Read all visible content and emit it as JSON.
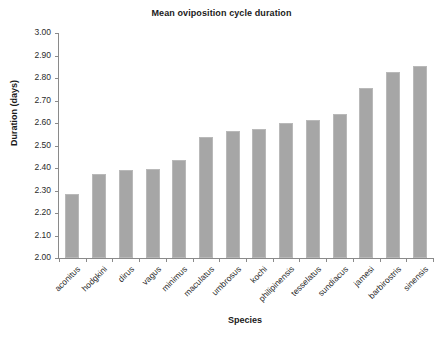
{
  "chart_data": {
    "type": "bar",
    "title": "Mean oviposition cycle duration",
    "xlabel": "Species",
    "ylabel": "Duration (days)",
    "categories": [
      "aconitus",
      "hodgkini",
      "dirus",
      "vagus",
      "minimus",
      "maculatus",
      "umbrosus",
      "kochi",
      "philipinensis",
      "tesselatus",
      "sundiacus",
      "jamesi",
      "barbirostris",
      "sinensis"
    ],
    "values": [
      2.285,
      2.375,
      2.39,
      2.395,
      2.435,
      2.54,
      2.565,
      2.575,
      2.6,
      2.615,
      2.64,
      2.755,
      2.825,
      2.855
    ],
    "ylim": [
      2.0,
      3.0
    ],
    "ytick_labels": [
      "3.00",
      "2.90",
      "2.80",
      "2.70",
      "2.60",
      "2.50",
      "2.40",
      "2.30",
      "2.20",
      "2.10",
      "2.00"
    ],
    "ytick_values": [
      3.0,
      2.9,
      2.8,
      2.7,
      2.6,
      2.5,
      2.4,
      2.3,
      2.2,
      2.1,
      2.0
    ],
    "grid": false,
    "legend": null,
    "bar_color": "#a6a6a6",
    "axis_color": "#8a8a8a"
  }
}
